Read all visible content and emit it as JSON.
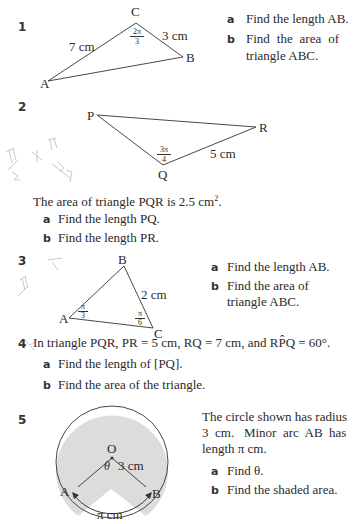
{
  "q1": {
    "number": "1",
    "vertices": {
      "A": "A",
      "B": "B",
      "C": "C"
    },
    "side_AC": "7 cm",
    "side_CB": "3 cm",
    "angle_C_num": "2π",
    "angle_C_den": "3",
    "parts": [
      {
        "label": "a",
        "text": "Find the length AB."
      },
      {
        "label": "b",
        "text_line1": "Find the area of",
        "text_line2": "triangle ABC."
      }
    ]
  },
  "q2": {
    "number": "2",
    "vertices": {
      "P": "P",
      "Q": "Q",
      "R": "R"
    },
    "side_QR": "5 cm",
    "angle_Q_num": "3π",
    "angle_Q_den": "4",
    "statement": "The area of triangle PQR is 2.5 cm",
    "statement_sup": "2",
    "statement_end": ".",
    "parts": [
      {
        "label": "a",
        "text": "Find the length PQ."
      },
      {
        "label": "b",
        "text": "Find the length PR."
      }
    ]
  },
  "q3": {
    "number": "3",
    "vertices": {
      "A": "A",
      "B": "B",
      "C": "C"
    },
    "side_BC": "2 cm",
    "angle_A_num": "π",
    "angle_A_den": "3",
    "angle_C_num": "π",
    "angle_C_den": "6",
    "parts": [
      {
        "label": "a",
        "text": "Find the length AB."
      },
      {
        "label": "b",
        "text_line1": "Find the area of",
        "text_line2": "triangle ABC."
      }
    ]
  },
  "q4": {
    "number": "4",
    "statement": "In triangle PQR,  PR = 5 cm,  RQ = 7 cm,  and  RP̂Q = 60°.",
    "parts": [
      {
        "label": "a",
        "text": "Find the length of [PQ]."
      },
      {
        "label": "b",
        "text": "Find the area of the triangle."
      }
    ]
  },
  "q5": {
    "number": "5",
    "center": "O",
    "angle": "θ",
    "radius_label": "3 cm",
    "point_A": "A",
    "point_B": "B",
    "arc_label": "π cm",
    "shade_color": "#dcdcdc",
    "desc_line1": "The circle shown has radius",
    "desc_line2": "3  cm.   Minor  arc  AB  has",
    "desc_line3": "length π cm.",
    "parts": [
      {
        "label": "a",
        "text": "Find θ."
      },
      {
        "label": "b",
        "text": "Find the shaded area."
      }
    ]
  }
}
